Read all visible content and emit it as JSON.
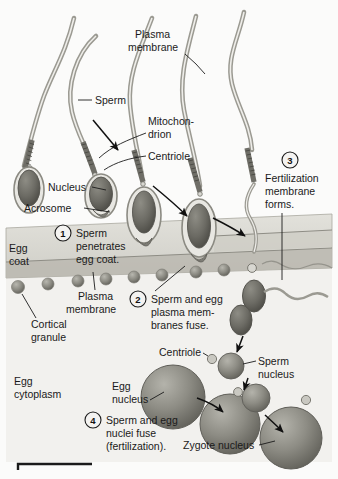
{
  "figure": {
    "type": "biological-process-diagram",
    "background_color": "#fbfbfa"
  },
  "colors": {
    "egg_coat": "#d9d8d2",
    "egg_coat_band": "#b9b7ae",
    "egg_cytoplasm": "#f2f1ee",
    "nucleus_fill": "#8b8a82",
    "nucleus_dark": "#6e6d66",
    "tail_stroke": "#9b9a92",
    "ink": "#1a1a1a",
    "granule": "#a9a8a0"
  },
  "labels": {
    "plasma_membrane_top": "Plasma\nmembrane",
    "plasma_membrane_top_l1": "Plasma",
    "plasma_membrane_top_l2": "membrane",
    "sperm": "Sperm",
    "mitochondrion_l1": "Mitochon-",
    "mitochondrion_l2": "drion",
    "centriole_top": "Centriole",
    "nucleus": "Nucleus",
    "acrosome": "Acrosome",
    "egg_coat_l1": "Egg",
    "egg_coat_l2": "coat",
    "plasma_membrane_l1": "Plasma",
    "plasma_membrane_l2": "membrane",
    "cortical_granule_l1": "Cortical",
    "cortical_granule_l2": "granule",
    "egg_cytoplasm_l1": "Egg",
    "egg_cytoplasm_l2": "cytoplasm",
    "centriole_lower": "Centriole",
    "sperm_nucleus_l1": "Sperm",
    "sperm_nucleus_l2": "nucleus",
    "egg_nucleus_l1": "Egg",
    "egg_nucleus_l2": "nucleus",
    "zygote_nucleus": "Zygote nucleus"
  },
  "steps": [
    {
      "number": "1",
      "lines": [
        "Sperm",
        "penetrates",
        "egg coat."
      ],
      "full_text": "Sperm penetrates egg coat."
    },
    {
      "number": "2",
      "lines": [
        "Sperm and egg",
        "plasma mem-",
        "branes fuse."
      ],
      "full_text": "Sperm and egg plasma membranes fuse."
    },
    {
      "number": "3",
      "lines": [
        "Fertilization",
        "membrane",
        "forms."
      ],
      "full_text": "Fertilization membrane forms."
    },
    {
      "number": "4",
      "lines": [
        "Sperm and egg",
        "nuclei fuse",
        "(fertilization)."
      ],
      "full_text": "Sperm and egg nuclei fuse (fertilization)."
    }
  ]
}
